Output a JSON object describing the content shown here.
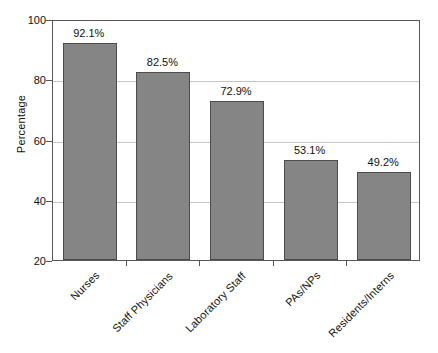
{
  "chart_data": {
    "type": "bar",
    "title": "",
    "subtitle": "",
    "xlabel": "",
    "ylabel": "Percentage",
    "categories": [
      "Nurses",
      "Staff Physicians",
      "Laboratory Staff",
      "PAs/NPs",
      "Residents/Interns"
    ],
    "values": [
      92.1,
      82.5,
      72.9,
      53.1,
      49.2
    ],
    "data_labels": [
      "92.1%",
      "82.5%",
      "72.9%",
      "53.1%",
      "49.2%"
    ],
    "ylim": [
      20,
      100
    ],
    "y_ticks": [
      20,
      40,
      60,
      80,
      100
    ],
    "y_tick_labels": [
      "20",
      "40",
      "60",
      "80",
      "100"
    ],
    "grid": true,
    "grid_axis": "y",
    "legend": false,
    "legend_position": "none",
    "series": [
      {
        "name": "Percentage",
        "values": [
          92.1,
          82.5,
          72.9,
          53.1,
          49.2
        ]
      }
    ],
    "colors": {
      "bar_fill": "#858585",
      "bar_edge": "#4c4c4c",
      "gridline": "#c3c5c7",
      "axis": "#55585c",
      "text": "#111111",
      "background": "#ffffff"
    }
  }
}
